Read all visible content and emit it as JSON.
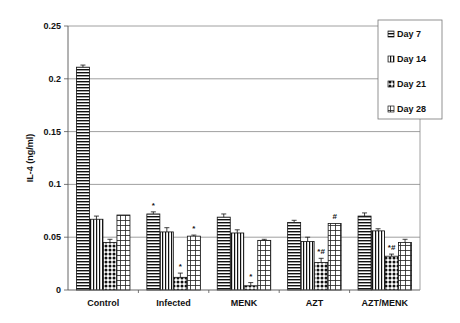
{
  "chart_data": {
    "type": "bar",
    "title": "",
    "xlabel": "",
    "ylabel": "IL-4 (ng/ml)",
    "ylim": [
      0,
      0.25
    ],
    "yticks": [
      "0",
      "0.05",
      "0.1",
      "0.15",
      "0.2",
      "0.25"
    ],
    "grid": true,
    "legend_position": "top-right",
    "categories": [
      "Control",
      "Infected",
      "MENK",
      "AZT",
      "AZT/MENK"
    ],
    "series": [
      {
        "name": "Day 7",
        "pattern": "horizontal-lines",
        "values": [
          0.211,
          0.072,
          0.069,
          0.064,
          0.07
        ],
        "errors": [
          0.002,
          0.002,
          0.003,
          0.002,
          0.003
        ]
      },
      {
        "name": "Day 14",
        "pattern": "vertical-lines",
        "values": [
          0.067,
          0.055,
          0.054,
          0.046,
          0.056
        ],
        "errors": [
          0.003,
          0.004,
          0.003,
          0.004,
          0.002
        ]
      },
      {
        "name": "Day 21",
        "pattern": "dots",
        "values": [
          0.045,
          0.012,
          0.004,
          0.026,
          0.032
        ],
        "errors": [
          0.003,
          0.004,
          0.003,
          0.004,
          0.002
        ]
      },
      {
        "name": "Day 28",
        "pattern": "grid",
        "values": [
          0.071,
          0.051,
          0.047,
          0.063,
          0.045
        ],
        "errors": [
          0.0,
          0.001,
          0.001,
          0.0,
          0.003
        ]
      }
    ],
    "annotations": [
      {
        "category": "Infected",
        "series": "Day 7",
        "text": "*"
      },
      {
        "category": "Infected",
        "series": "Day 21",
        "text": "*"
      },
      {
        "category": "Infected",
        "series": "Day 28",
        "text": "*"
      },
      {
        "category": "MENK",
        "series": "Day 21",
        "text": "*"
      },
      {
        "category": "AZT",
        "series": "Day 21",
        "text": "*#"
      },
      {
        "category": "AZT",
        "series": "Day 28",
        "text": "#"
      },
      {
        "category": "AZT/MENK",
        "series": "Day 21",
        "text": "*#"
      }
    ]
  }
}
